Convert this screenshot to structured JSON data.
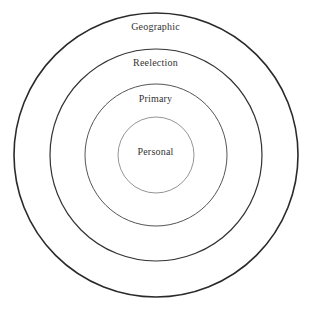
{
  "figure": {
    "type": "concentric-rings-diagram",
    "background_color": "#ffffff",
    "center": {
      "x": 156,
      "y": 155
    },
    "rings": [
      {
        "label": "Geographic",
        "level": 1,
        "radius": 142,
        "stroke_color": "#2a2a2a",
        "stroke_width": 1.6,
        "label_top": 21
      },
      {
        "label": "Reelection",
        "level": 2,
        "radius": 106,
        "stroke_color": "#333333",
        "stroke_width": 1.2,
        "label_top": 57
      },
      {
        "label": "Primary",
        "level": 3,
        "radius": 71,
        "stroke_color": "#555555",
        "stroke_width": 1.0,
        "label_top": 93
      },
      {
        "label": "Personal",
        "level": 4,
        "radius": 38,
        "stroke_color": "#888888",
        "stroke_width": 0.9,
        "label_top": 146
      }
    ],
    "text_color": "#333333"
  }
}
